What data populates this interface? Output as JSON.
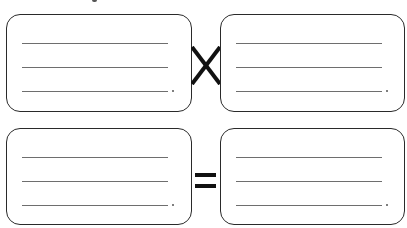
{
  "diagram": {
    "title_fragment": "",
    "colors": {
      "box_border": "#2a2a2a",
      "line": "#6e6e6e",
      "operator": "#111111",
      "background": "#ffffff"
    },
    "rows": [
      {
        "operator": "multiply",
        "operator_symbol": "×",
        "boxes": [
          {
            "position": "top-left",
            "lines": [
              "",
              "",
              ""
            ],
            "end_mark": "."
          },
          {
            "position": "top-right",
            "lines": [
              "",
              "",
              ""
            ],
            "end_mark": "."
          }
        ]
      },
      {
        "operator": "equals",
        "operator_symbol": "=",
        "boxes": [
          {
            "position": "bottom-left",
            "lines": [
              "",
              "",
              ""
            ],
            "end_mark": "."
          },
          {
            "position": "bottom-right",
            "lines": [
              "",
              "",
              ""
            ],
            "end_mark": "."
          }
        ]
      }
    ]
  }
}
